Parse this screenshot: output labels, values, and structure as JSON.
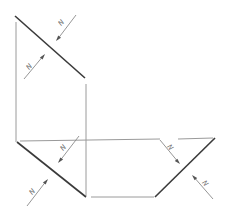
{
  "diagram": {
    "colors": {
      "background": "#ffffff",
      "edge": "#9a9a9a",
      "face": "#3a3a3a",
      "vector": "#8a8a8a",
      "label": "#666666"
    },
    "faces": [
      {
        "id": "upper-left-plane",
        "x1": 15,
        "y1": 16,
        "x2": 85,
        "y2": 78
      },
      {
        "id": "lower-left-plane",
        "x1": 17,
        "y1": 142,
        "x2": 86,
        "y2": 197
      },
      {
        "id": "lower-right-plane",
        "x1": 155,
        "y1": 197,
        "x2": 215,
        "y2": 138
      }
    ],
    "forces": [
      {
        "label": "N",
        "target": "upper-left-plane",
        "side": "above"
      },
      {
        "label": "N",
        "target": "upper-left-plane",
        "side": "below"
      },
      {
        "label": "N",
        "target": "lower-left-plane",
        "side": "above"
      },
      {
        "label": "N",
        "target": "lower-left-plane",
        "side": "below"
      },
      {
        "label": "N",
        "target": "lower-right-plane",
        "side": "above"
      },
      {
        "label": "N",
        "target": "lower-right-plane",
        "side": "below"
      }
    ]
  }
}
